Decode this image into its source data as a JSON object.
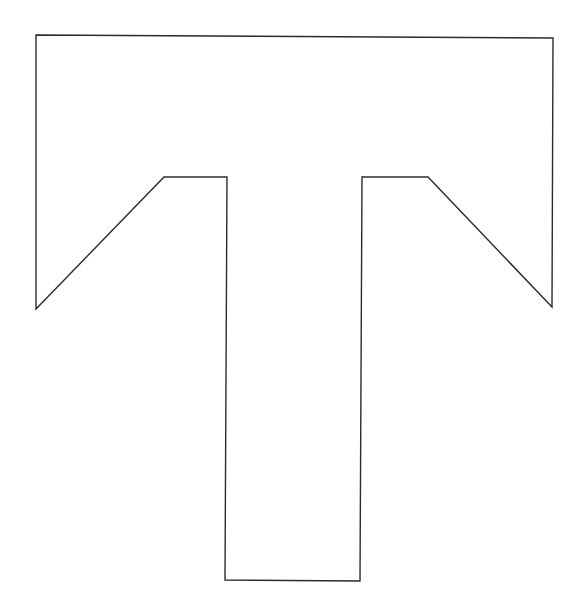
{
  "drawing": {
    "subject": "letter-T-outline",
    "letter": "T",
    "canvas": {
      "width": 585,
      "height": 613
    },
    "colors": {
      "background": "#ffffff",
      "stroke": "#2b2b2b",
      "fill": "#ffffff"
    },
    "stroke_width": 1.4,
    "outline_points": [
      [
        36,
        35
      ],
      [
        553,
        38
      ],
      [
        552,
        307
      ],
      [
        428,
        177
      ],
      [
        362,
        177
      ],
      [
        360,
        581
      ],
      [
        225,
        580
      ],
      [
        227,
        177
      ],
      [
        164,
        177
      ],
      [
        36,
        309
      ]
    ]
  }
}
